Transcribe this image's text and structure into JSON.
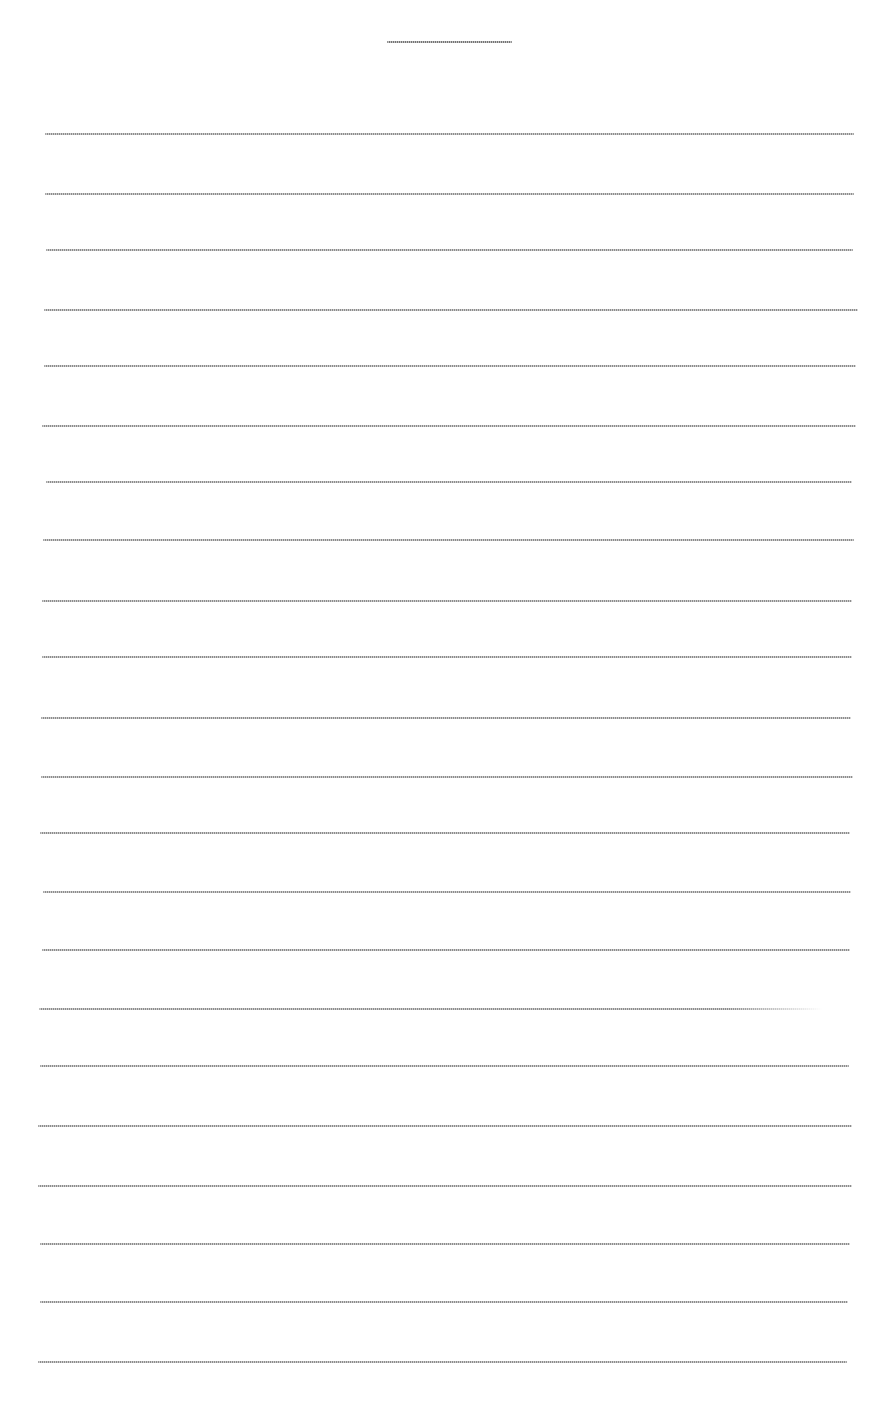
{
  "page": {
    "type": "blank-lined-writing-sheet",
    "background_color": "#ffffff",
    "line_color": "#8a8a8a",
    "title_line": {
      "x1": 387,
      "x2": 512,
      "y": 42
    },
    "ruled_lines": [
      {
        "x1": 45,
        "x2": 854,
        "y": 134
      },
      {
        "x1": 45,
        "x2": 854,
        "y": 194
      },
      {
        "x1": 46,
        "x2": 853,
        "y": 250
      },
      {
        "x1": 44,
        "x2": 858,
        "y": 310
      },
      {
        "x1": 44,
        "x2": 856,
        "y": 366
      },
      {
        "x1": 42,
        "x2": 856,
        "y": 426
      },
      {
        "x1": 46,
        "x2": 852,
        "y": 482
      },
      {
        "x1": 43,
        "x2": 854,
        "y": 540
      },
      {
        "x1": 42,
        "x2": 852,
        "y": 601
      },
      {
        "x1": 42,
        "x2": 852,
        "y": 657
      },
      {
        "x1": 41,
        "x2": 851,
        "y": 718
      },
      {
        "x1": 41,
        "x2": 853,
        "y": 777
      },
      {
        "x1": 40,
        "x2": 850,
        "y": 833
      },
      {
        "x1": 43,
        "x2": 851,
        "y": 892
      },
      {
        "x1": 42,
        "x2": 850,
        "y": 950
      },
      {
        "x1": 39,
        "x2": 822,
        "y": 1009,
        "fades_right": true
      },
      {
        "x1": 40,
        "x2": 849,
        "y": 1066
      },
      {
        "x1": 38,
        "x2": 852,
        "y": 1126
      },
      {
        "x1": 38,
        "x2": 852,
        "y": 1186
      },
      {
        "x1": 40,
        "x2": 850,
        "y": 1244
      },
      {
        "x1": 40,
        "x2": 848,
        "y": 1302
      },
      {
        "x1": 38,
        "x2": 847,
        "y": 1362
      }
    ]
  }
}
